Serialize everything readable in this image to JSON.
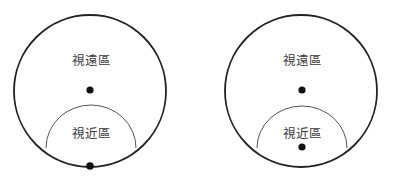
{
  "diagram": {
    "type": "lens-zone-comparison",
    "colors": {
      "outline": "#222222",
      "inner_arc": "#555555",
      "dot": "#111111",
      "text": "#3a3a3a",
      "background": "#ffffff"
    },
    "panels": [
      {
        "id": "left",
        "far_zone_label": "視遠區",
        "near_zone_label": "視近區",
        "outer_circle": {
          "cx": 90,
          "cy": 91,
          "r": 76
        },
        "near_zone_arc": {
          "x1": 46,
          "y1": 148,
          "x2": 136,
          "y2": 148,
          "top_y": 105
        },
        "dots": [
          {
            "role": "far-center",
            "cx": 90,
            "cy": 90
          },
          {
            "role": "near-point-on-edge",
            "cx": 90,
            "cy": 166
          }
        ],
        "far_label_pos": {
          "x": 91,
          "y": 65
        },
        "near_label_pos": {
          "x": 91,
          "y": 138
        }
      },
      {
        "id": "right",
        "far_zone_label": "視遠區",
        "near_zone_label": "視近區",
        "outer_circle": {
          "cx": 301,
          "cy": 91,
          "r": 76
        },
        "near_zone_arc": {
          "x1": 257,
          "y1": 148,
          "x2": 347,
          "y2": 148,
          "top_y": 106
        },
        "dots": [
          {
            "role": "far-center",
            "cx": 302,
            "cy": 90
          },
          {
            "role": "near-center",
            "cx": 302,
            "cy": 146
          }
        ],
        "far_label_pos": {
          "x": 302,
          "y": 65
        },
        "near_label_pos": {
          "x": 302,
          "y": 138
        }
      }
    ]
  }
}
